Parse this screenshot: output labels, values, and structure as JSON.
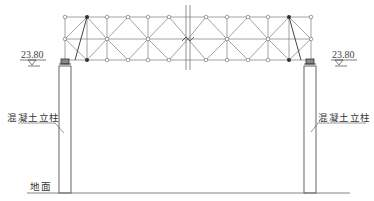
{
  "labels": {
    "elevation_left": "23.80",
    "elevation_right": "23.80",
    "column_left": "混凝土立柱",
    "column_right": "混凝土立柱",
    "ground": "地面"
  },
  "geometry": {
    "truss": {
      "top_y": 17,
      "mid_y": 39,
      "bottom_y": 60,
      "left_x": 65,
      "right_x": 311,
      "break_x": 188
    },
    "left_half_nodes_x": [
      65,
      87,
      107,
      128,
      148,
      169
    ],
    "right_half_nodes_x": [
      206,
      227,
      248,
      268,
      289,
      311
    ],
    "columns": [
      {
        "name": "left",
        "x": 59,
        "width": 12,
        "top": 66,
        "bottom": 193
      },
      {
        "name": "right",
        "x": 304,
        "width": 12,
        "top": 66,
        "bottom": 193
      }
    ],
    "ground_y": 193,
    "ground_x": [
      27,
      350
    ]
  },
  "colors": {
    "line": "#7a7a7a",
    "dark": "#333333",
    "node_fill": "#ffffff"
  }
}
